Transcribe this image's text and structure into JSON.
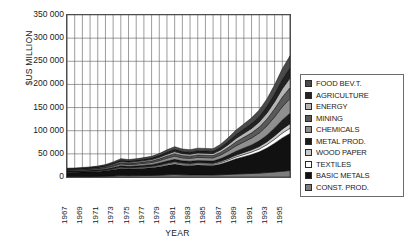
{
  "chart_data": {
    "type": "area",
    "title": "",
    "xlabel": "YEAR",
    "ylabel": "$US MILLION",
    "ylim": [
      0,
      350000
    ],
    "ytick_labels": [
      "350 000",
      "300 000",
      "250 000",
      "200 000",
      "150 000",
      "100 000",
      "50 000",
      "0"
    ],
    "ytick_values": [
      350000,
      300000,
      250000,
      200000,
      150000,
      100000,
      50000,
      0
    ],
    "grid": "vertical-yearly-and-horizontal",
    "legend_position": "right",
    "stacked": true,
    "x": [
      1967,
      1968,
      1969,
      1970,
      1971,
      1972,
      1973,
      1974,
      1975,
      1976,
      1977,
      1978,
      1979,
      1980,
      1981,
      1982,
      1983,
      1984,
      1985,
      1986,
      1987,
      1988,
      1989,
      1990,
      1991,
      1992,
      1993,
      1994,
      1995,
      1996
    ],
    "xtick_labels": [
      "1967",
      "1969",
      "1971",
      "1973",
      "1975",
      "1977",
      "1979",
      "1981",
      "1983",
      "1985",
      "1987",
      "1989",
      "1991",
      "1993",
      "1995"
    ],
    "series": [
      {
        "name": "CONST. PROD.",
        "color": "#7d7d7d",
        "values": [
          900,
          950,
          1000,
          1100,
          1300,
          1600,
          2200,
          3000,
          2800,
          3000,
          3200,
          3400,
          3900,
          4600,
          5200,
          4600,
          4400,
          4500,
          4400,
          4300,
          4800,
          5600,
          6400,
          7000,
          7600,
          8400,
          9600,
          11000,
          12500,
          14000
        ]
      },
      {
        "name": "BASIC METALS",
        "color": "#111111",
        "values": [
          9000,
          9200,
          9600,
          10200,
          10800,
          11800,
          13500,
          15500,
          14500,
          15000,
          15800,
          16500,
          18500,
          21000,
          23000,
          21000,
          20500,
          21500,
          21000,
          20500,
          23500,
          28000,
          33000,
          37000,
          41000,
          46000,
          53000,
          62000,
          72000,
          80000
        ]
      },
      {
        "name": "TEXTILES",
        "color": "#ffffff",
        "values": [
          800,
          820,
          860,
          900,
          950,
          1050,
          1250,
          1500,
          1450,
          1500,
          1600,
          1700,
          1900,
          2200,
          2450,
          2300,
          2250,
          2400,
          2400,
          2400,
          2800,
          3400,
          4100,
          4700,
          5300,
          6100,
          7200,
          8600,
          10200,
          11500
        ]
      },
      {
        "name": "WOOD PAPER",
        "color": "#c9c9c9",
        "values": [
          700,
          720,
          750,
          800,
          850,
          950,
          1150,
          1400,
          1350,
          1400,
          1500,
          1600,
          1800,
          2100,
          2350,
          2200,
          2150,
          2300,
          2300,
          2300,
          2700,
          3200,
          3800,
          4300,
          4800,
          5400,
          6300,
          7400,
          8700,
          9800
        ]
      },
      {
        "name": "METAL PROD.",
        "color": "#1c1c1c",
        "values": [
          1400,
          1450,
          1500,
          1600,
          1750,
          2000,
          2450,
          3000,
          2900,
          3050,
          3250,
          3500,
          3950,
          4600,
          5150,
          4800,
          4700,
          5000,
          5000,
          5000,
          5900,
          7100,
          8500,
          9600,
          10700,
          12200,
          14300,
          17000,
          20000,
          22500
        ]
      },
      {
        "name": "CHEMICALS",
        "color": "#8f8f8f",
        "values": [
          1600,
          1650,
          1750,
          1900,
          2100,
          2450,
          3100,
          3900,
          3750,
          3950,
          4250,
          4600,
          5250,
          6200,
          7000,
          6500,
          6350,
          6800,
          6800,
          6800,
          8000,
          9700,
          11700,
          13300,
          14900,
          17000,
          20000,
          23800,
          28200,
          31800
        ]
      },
      {
        "name": "MINING",
        "color": "#5a5a5a",
        "values": [
          1200,
          1240,
          1300,
          1400,
          1550,
          1800,
          2300,
          2900,
          2800,
          2950,
          3150,
          3400,
          3900,
          4600,
          5200,
          4850,
          4750,
          5050,
          5050,
          5050,
          5950,
          7200,
          8700,
          9900,
          11100,
          12700,
          14900,
          17700,
          21000,
          23600
        ]
      },
      {
        "name": "ENERGY",
        "color": "#b5b5b5",
        "values": [
          1000,
          1030,
          1080,
          1160,
          1280,
          1500,
          1950,
          2500,
          2400,
          2530,
          2710,
          2930,
          3370,
          3980,
          4500,
          4200,
          4120,
          4380,
          4380,
          4380,
          5160,
          6250,
          7540,
          8580,
          9620,
          11000,
          12900,
          15300,
          18200,
          20500
        ]
      },
      {
        "name": "AGRICULTURE",
        "color": "#232323",
        "values": [
          1100,
          1130,
          1190,
          1270,
          1400,
          1640,
          2120,
          2700,
          2600,
          2740,
          2930,
          3170,
          3640,
          4300,
          4860,
          4540,
          4450,
          4730,
          4730,
          4730,
          5570,
          6750,
          8150,
          9270,
          10390,
          11880,
          13940,
          16540,
          19650,
          22100
        ]
      },
      {
        "name": "FOOD BEV.T.",
        "color": "#4a4a4a",
        "values": [
          1300,
          1340,
          1410,
          1510,
          1670,
          1960,
          2530,
          3200,
          3100,
          3270,
          3500,
          3780,
          4340,
          5120,
          5790,
          5410,
          5300,
          5630,
          5630,
          5630,
          6630,
          8040,
          9700,
          11040,
          12370,
          14140,
          16600,
          19700,
          23400,
          26300
        ]
      }
    ]
  },
  "legend": {
    "items": [
      {
        "label": "FOOD BEV.T.",
        "color": "#4a4a4a"
      },
      {
        "label": "AGRICULTURE",
        "color": "#232323"
      },
      {
        "label": "ENERGY",
        "color": "#b5b5b5"
      },
      {
        "label": "MINING",
        "color": "#5a5a5a"
      },
      {
        "label": "CHEMICALS",
        "color": "#8f8f8f"
      },
      {
        "label": "METAL PROD.",
        "color": "#1c1c1c"
      },
      {
        "label": "WOOD PAPER",
        "color": "#c9c9c9"
      },
      {
        "label": "TEXTILES",
        "color": "#ffffff"
      },
      {
        "label": "BASIC METALS",
        "color": "#111111"
      },
      {
        "label": "CONST. PROD.",
        "color": "#7d7d7d"
      }
    ]
  }
}
